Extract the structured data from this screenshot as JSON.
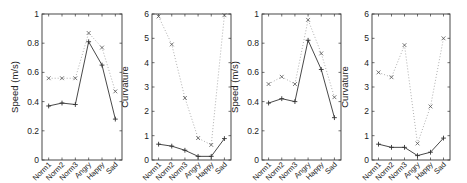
{
  "chart_data": [
    {
      "type": "line",
      "title": "",
      "xlabel": "",
      "ylabel": "Speed (m/s)",
      "ylim": [
        0,
        1
      ],
      "yticks": [
        "0",
        "0.2",
        "0.4",
        "0.6",
        "0.8",
        "1"
      ],
      "categories": [
        "Norm1",
        "Norm2",
        "Norm3",
        "Angry",
        "Happy",
        "Sad"
      ],
      "grid": false,
      "series": [
        {
          "name": "solid-plus",
          "style": "solid",
          "marker": "+",
          "values": [
            0.37,
            0.39,
            0.38,
            0.81,
            0.65,
            0.28
          ]
        },
        {
          "name": "dotted-x",
          "style": "dotted",
          "marker": "x",
          "values": [
            0.56,
            0.56,
            0.56,
            0.87,
            0.77,
            0.47
          ]
        }
      ]
    },
    {
      "type": "line",
      "title": "",
      "xlabel": "",
      "ylabel": "Curvature",
      "ylim": [
        0,
        6
      ],
      "yticks": [
        "0",
        "1",
        "2",
        "3",
        "4",
        "5",
        "6"
      ],
      "categories": [
        "Norm1",
        "Norm2",
        "Norm3",
        "Angry",
        "Happy",
        "Sad"
      ],
      "grid": false,
      "series": [
        {
          "name": "solid-plus",
          "style": "solid",
          "marker": "+",
          "values": [
            0.65,
            0.57,
            0.4,
            0.15,
            0.15,
            0.88
          ]
        },
        {
          "name": "dotted-x",
          "style": "dotted",
          "marker": "x",
          "values": [
            5.9,
            4.75,
            2.55,
            0.9,
            0.62,
            5.95
          ]
        }
      ]
    },
    {
      "type": "line",
      "title": "",
      "xlabel": "",
      "ylabel": "Speed (m/s)",
      "ylim": [
        0,
        1
      ],
      "yticks": [
        "0",
        "0.2",
        "0.4",
        "0.6",
        "0.8",
        "1"
      ],
      "categories": [
        "Norm1",
        "Norm2",
        "Norm3",
        "Angry",
        "Happy",
        "Sad"
      ],
      "grid": false,
      "series": [
        {
          "name": "solid-plus",
          "style": "solid",
          "marker": "+",
          "values": [
            0.39,
            0.42,
            0.4,
            0.82,
            0.62,
            0.29
          ]
        },
        {
          "name": "dotted-x",
          "style": "dotted",
          "marker": "x",
          "values": [
            0.52,
            0.57,
            0.52,
            0.96,
            0.73,
            0.43
          ]
        }
      ]
    },
    {
      "type": "line",
      "title": "",
      "xlabel": "",
      "ylabel": "Curvature",
      "ylim": [
        0,
        6
      ],
      "yticks": [
        "0",
        "1",
        "2",
        "3",
        "4",
        "5",
        "6"
      ],
      "categories": [
        "Norm1",
        "Norm2",
        "Norm3",
        "Angry",
        "Happy",
        "Sad"
      ],
      "grid": false,
      "series": [
        {
          "name": "solid-plus",
          "style": "solid",
          "marker": "+",
          "values": [
            0.65,
            0.52,
            0.52,
            0.18,
            0.32,
            0.9
          ]
        },
        {
          "name": "dotted-x",
          "style": "dotted",
          "marker": "x",
          "values": [
            3.6,
            3.4,
            4.72,
            0.68,
            2.2,
            5.0
          ]
        }
      ]
    }
  ],
  "layout": {
    "panels": [
      {
        "left": 42,
        "top": 14,
        "right": 122,
        "bottom": 160
      },
      {
        "left": 152,
        "top": 14,
        "right": 231,
        "bottom": 160
      },
      {
        "left": 262,
        "top": 14,
        "right": 341,
        "bottom": 160
      },
      {
        "left": 372,
        "top": 14,
        "right": 450,
        "bottom": 160
      }
    ],
    "colors": {
      "axis": "#333333",
      "solid": "#333333",
      "dotted": "#9a9a9a",
      "marker_x": "#555555"
    }
  }
}
